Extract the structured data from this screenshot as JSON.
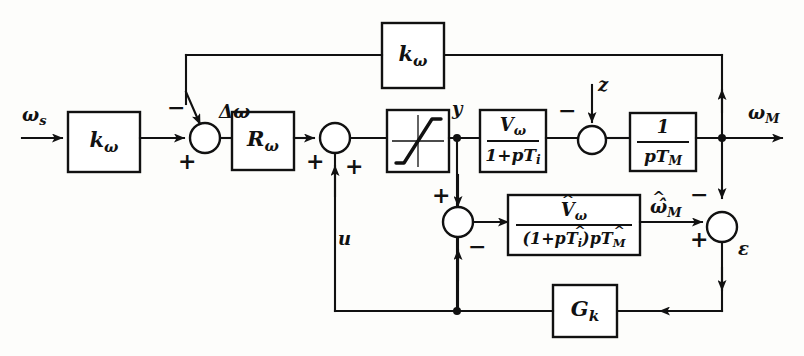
{
  "diagram": {
    "type": "control-block-diagram",
    "line_color": "#111111",
    "background_color": "#fdfdfb"
  },
  "blocks": [
    {
      "id": "k_omega_forward",
      "label": "k",
      "sub": "ω",
      "kind": "gain",
      "x": 68,
      "y": 112,
      "w": 72,
      "h": 60
    },
    {
      "id": "r_omega",
      "label": "R",
      "sub": "ω",
      "kind": "controller",
      "x": 232,
      "y": 112,
      "w": 62,
      "h": 58
    },
    {
      "id": "saturation",
      "label": "",
      "sub": "",
      "kind": "saturation-limiter",
      "x": 387,
      "y": 110,
      "w": 62,
      "h": 62
    },
    {
      "id": "v_omega_lag",
      "numerator": "Vω",
      "denominator": "1+pTᵢ",
      "kind": "transfer-function",
      "x": 480,
      "y": 110,
      "w": 66,
      "h": 62
    },
    {
      "id": "integrator_pTM",
      "numerator": "1",
      "denominator": "pT_M",
      "kind": "integrator",
      "x": 630,
      "y": 113,
      "w": 66,
      "h": 58
    },
    {
      "id": "k_omega_feedback",
      "label": "k",
      "sub": "ω",
      "kind": "gain",
      "x": 382,
      "y": 23,
      "w": 62,
      "h": 65
    },
    {
      "id": "observer_model",
      "numerator": "V̂ω",
      "denominator": "(1+pT̂ᵢ)pT̂_M",
      "kind": "observer-model",
      "x": 508,
      "y": 195,
      "w": 132,
      "h": 60
    },
    {
      "id": "g_k",
      "label": "G",
      "sub": "k",
      "kind": "observer-gain",
      "x": 553,
      "y": 285,
      "w": 64,
      "h": 52
    }
  ],
  "block_labels": {
    "k_omega_forward": "k",
    "k_omega_forward_sub": "ω",
    "r_omega": "R",
    "r_omega_sub": "ω",
    "k_omega_feedback": "k",
    "k_omega_feedback_sub": "ω",
    "g_k": "G",
    "g_k_sub": "k",
    "v_omega_num": "V",
    "v_omega_num_sub": "ω",
    "v_omega_den": "1+pT",
    "v_omega_den_sub": "i",
    "integrator_num": "1",
    "integrator_den": "pT",
    "integrator_den_sub": "M",
    "observer_num": "V",
    "observer_num_sub": "ω",
    "observer_den_pre": "(1+pT",
    "observer_den_sub1": "i",
    "observer_den_mid": ")pT",
    "observer_den_sub2": "M"
  },
  "signals": [
    {
      "id": "input_reference",
      "label": "ω",
      "sub": "s",
      "x": 30,
      "y": 117,
      "description": "speed setpoint input"
    },
    {
      "id": "control_deviation",
      "label": "Δω",
      "sub": "",
      "x": 196,
      "y": 112,
      "description": "speed error"
    },
    {
      "id": "limiter_output",
      "label": "y",
      "sub": "",
      "x": 456,
      "y": 108,
      "description": "limited controller output"
    },
    {
      "id": "disturbance",
      "label": "z",
      "sub": "",
      "x": 592,
      "y": 90,
      "description": "load disturbance input"
    },
    {
      "id": "output_speed",
      "label": "ω",
      "sub": "M",
      "x": 752,
      "y": 115,
      "description": "motor speed output"
    },
    {
      "id": "observer_speed",
      "label": "ω̂",
      "sub": "M",
      "x": 652,
      "y": 195,
      "description": "estimated motor speed"
    },
    {
      "id": "observer_error",
      "label": "ε",
      "sub": "",
      "x": 740,
      "y": 242,
      "description": "observer error"
    },
    {
      "id": "compensation",
      "label": "u",
      "sub": "",
      "x": 340,
      "y": 237,
      "description": "compensation signal"
    }
  ],
  "summing_junctions": [
    {
      "id": "sum_error",
      "cx": 205,
      "cy": 138,
      "r": 15,
      "signs": [
        {
          "sign": "−",
          "position": "top"
        },
        {
          "sign": "+",
          "position": "bottom-left"
        }
      ]
    },
    {
      "id": "sum_control",
      "cx": 335,
      "cy": 138,
      "r": 15,
      "signs": [
        {
          "sign": "+",
          "position": "left"
        },
        {
          "sign": "+",
          "position": "bottom-right"
        }
      ]
    },
    {
      "id": "sum_disturbance",
      "cx": 592,
      "cy": 140,
      "r": 14,
      "signs": [
        {
          "sign": "−",
          "position": "top-left"
        }
      ]
    },
    {
      "id": "sum_observer_input",
      "cx": 458,
      "cy": 222,
      "r": 15,
      "signs": [
        {
          "sign": "+",
          "position": "top-left"
        },
        {
          "sign": "−",
          "position": "bottom-right"
        }
      ]
    },
    {
      "id": "sum_observer_error",
      "cx": 722,
      "cy": 227,
      "r": 15,
      "signs": [
        {
          "sign": "−",
          "position": "top-right"
        },
        {
          "sign": "+",
          "position": "bottom-left"
        }
      ]
    }
  ],
  "junction_dots": [
    {
      "id": "dot_y",
      "cx": 457,
      "cy": 138,
      "r": 4
    },
    {
      "id": "dot_omega_m",
      "cx": 722,
      "cy": 138,
      "r": 4
    },
    {
      "id": "dot_bottom_y",
      "cx": 457,
      "cy": 311,
      "r": 4
    }
  ],
  "signs": {
    "minus": "−",
    "plus": "+"
  }
}
